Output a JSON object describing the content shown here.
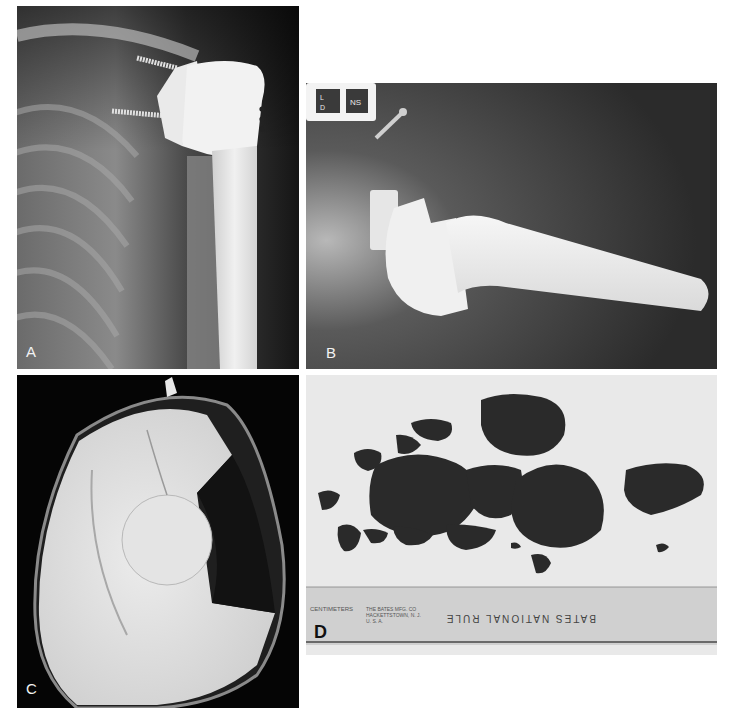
{
  "figure": {
    "panels": [
      {
        "id": "A",
        "label": "A",
        "description": "AP shoulder radiograph showing reverse total shoulder prosthesis with glenoid baseplate screws and humeral stem",
        "bounds": {
          "x": 17,
          "y": 6,
          "w": 282,
          "h": 363
        }
      },
      {
        "id": "B",
        "label": "B",
        "description": "Axillary radiograph of reverse shoulder prosthesis with humeral stem and glenosphere",
        "bounds": {
          "x": 306,
          "y": 83,
          "w": 411,
          "h": 286
        },
        "marker_text": [
          "NS",
          "L",
          "D"
        ]
      },
      {
        "id": "C",
        "label": "C",
        "description": "Retrieved polyethylene humeral insert showing wear and notching",
        "bounds": {
          "x": 17,
          "y": 375,
          "w": 282,
          "h": 333
        }
      },
      {
        "id": "D",
        "label": "D",
        "description": "Excised dark metallosis / wear debris tissue fragments with ruler for scale",
        "bounds": {
          "x": 306,
          "y": 375,
          "w": 411,
          "h": 280
        },
        "ruler": {
          "unit_label": "CENTIMETERS",
          "cm_ticks": [
            "1",
            "2",
            "3",
            "4",
            "5",
            "6",
            "7",
            "8",
            "9",
            "10",
            "11",
            "12",
            "13",
            "14",
            "15",
            "16",
            "17",
            "18",
            "19",
            "2"
          ],
          "manufacturer_lines": [
            "THE BATES MFG. CO",
            "HACKETTSTOWN, N. J.",
            "U. S. A.",
            "07840"
          ],
          "brand": "BATES NATIONAL RULE",
          "inch_ticks": [
            "12",
            "11",
            "10",
            "9",
            "8",
            "7",
            "6",
            "5"
          ]
        }
      }
    ]
  },
  "colors": {
    "background": "#ffffff",
    "xray_dark": "#1a1a1a",
    "implant": "#e8e8e8",
    "tray_background": "#e9e9e9",
    "ruler": "#d2d2d2",
    "debris": "#2a2a2a"
  }
}
